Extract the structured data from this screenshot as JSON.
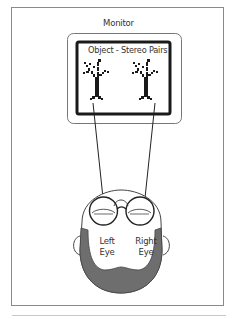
{
  "diagram": {
    "monitor_label": "Monitor",
    "screen_label": "Object - Stereo Pairs",
    "left_eye": {
      "line1": "Left",
      "line2": "Eye"
    },
    "right_eye": {
      "line1": "Right",
      "line2": "Eye"
    }
  },
  "colors": {
    "frame": "#8a8a8a",
    "outline": "#222222",
    "beard": "#6e6e6e",
    "screen_bezel": "#1a1a1a"
  }
}
